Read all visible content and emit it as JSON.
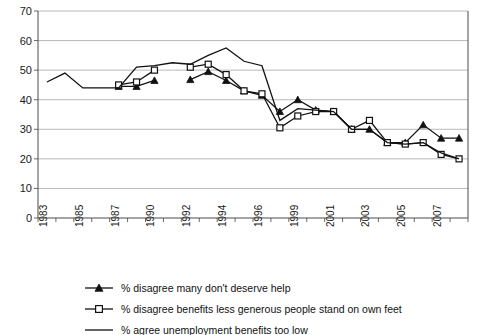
{
  "chart_data": {
    "type": "line",
    "title": "",
    "xlabel": "",
    "ylabel": "",
    "ylim": [
      0,
      70
    ],
    "ytick_step": 10,
    "yticks": [
      0,
      10,
      20,
      30,
      40,
      50,
      60,
      70
    ],
    "grid": true,
    "legend_position": "bottom-left",
    "x": [
      1983,
      1984,
      1985,
      1986,
      1987,
      1989,
      1990,
      1991,
      1992,
      1993,
      1994,
      1995,
      1996,
      1998,
      1999,
      2000,
      2001,
      2002,
      2003,
      2004,
      2005,
      2006,
      2007,
      2008
    ],
    "xtick_labels": [
      "1983",
      "",
      "1985",
      "",
      "1987",
      "",
      "1990",
      "",
      "1992",
      "",
      "1994",
      "",
      "1996",
      "",
      "1999",
      "",
      "2001",
      "",
      "2003",
      "",
      "2005",
      "",
      "2007",
      ""
    ],
    "series": [
      {
        "name": "% disagree many don't deserve help",
        "marker": "filled-triangle",
        "values": [
          null,
          null,
          null,
          null,
          44.5,
          44.5,
          46.5,
          null,
          46.8,
          49.5,
          46.5,
          43,
          41.5,
          36,
          40,
          36.5,
          36,
          30,
          30,
          25.5,
          25.5,
          31.5,
          27,
          27
        ]
      },
      {
        "name": "% disagree benefits less generous people stand on own feet",
        "marker": "open-square",
        "values": [
          null,
          null,
          null,
          null,
          45,
          46,
          50,
          null,
          51,
          52,
          48.5,
          43,
          42,
          30.5,
          34.5,
          36,
          36,
          30,
          33,
          25.5,
          25,
          25.5,
          21.5,
          20
        ]
      },
      {
        "name": "% agree unemployment benefits too low",
        "marker": "none",
        "values": [
          46,
          49,
          44,
          44,
          44,
          51,
          51.5,
          52.5,
          52,
          55,
          57.5,
          53,
          51.5,
          33,
          37,
          36.5,
          36,
          30,
          30,
          25.5,
          25,
          25.5,
          22,
          20
        ]
      }
    ]
  },
  "legend": {
    "items": [
      {
        "label": "% disagree many don't deserve help",
        "marker": "filled-triangle"
      },
      {
        "label": "% disagree benefits less generous people stand on own feet",
        "marker": "open-square"
      },
      {
        "label": "% agree unemployment benefits too low",
        "marker": "none"
      }
    ]
  }
}
